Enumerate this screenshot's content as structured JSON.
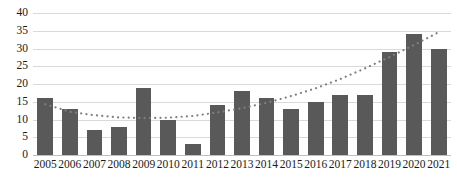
{
  "chart_data": {
    "type": "bar",
    "title": "",
    "subtitle": "",
    "xlabel": "",
    "ylabel": "",
    "ylim": [
      0,
      40
    ],
    "ytick_step": 5,
    "yticks": [
      "40",
      "35",
      "30",
      "25",
      "20",
      "15",
      "10",
      "5",
      "0"
    ],
    "grid": true,
    "legend": "none",
    "categories": [
      "2005",
      "2006",
      "2007",
      "2008",
      "2009",
      "2010",
      "2011",
      "2012",
      "2013",
      "2014",
      "2015",
      "2016",
      "2017",
      "2018",
      "2019",
      "2020",
      "2021"
    ],
    "values": [
      16,
      13,
      7,
      8,
      19,
      10,
      3,
      14,
      18,
      16,
      13,
      15,
      17,
      17,
      29,
      34,
      30
    ],
    "series": [
      {
        "name": "bars",
        "style": "bar",
        "color": "#595959",
        "values": [
          16,
          13,
          7,
          8,
          19,
          10,
          3,
          14,
          18,
          16,
          13,
          15,
          17,
          17,
          29,
          34,
          30
        ]
      },
      {
        "name": "trendline",
        "style": "dotted-polynomial",
        "color": "#808080",
        "values": [
          14.3,
          12.2,
          11.2,
          10.6,
          10.4,
          10.5,
          11.0,
          12.0,
          13.2,
          14.7,
          16.6,
          18.8,
          21.4,
          24.4,
          27.6,
          31.0,
          34.6
        ]
      }
    ],
    "colors": {
      "bar": "#595959",
      "trendline": "#808080",
      "gridline": "#d9d9d9",
      "axis": "#bfbfbf",
      "background": "#ffffff",
      "text": "#1a1a1a"
    }
  }
}
